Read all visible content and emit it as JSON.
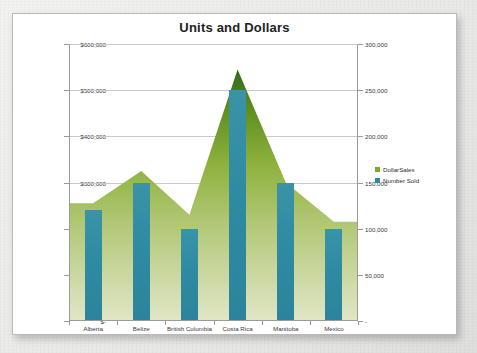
{
  "chart_data": {
    "type": "area",
    "title": "Units and Dollars",
    "categories": [
      "Alberta",
      "Belize",
      "British Columbia",
      "Costa Rica",
      "Manitoba",
      "Mexico"
    ],
    "series": [
      {
        "name": "DollarSales",
        "type": "area",
        "axis": "left",
        "color": "#7fa92e",
        "values": [
          255000,
          325000,
          230000,
          545000,
          300000,
          215000
        ]
      },
      {
        "name": "Number Sold",
        "type": "bar",
        "axis": "right",
        "color": "#2f8ba2",
        "values": [
          120000,
          150000,
          100000,
          250000,
          150000,
          100000
        ]
      }
    ],
    "xlabel": "",
    "ylabel": "",
    "ylim": [
      0,
      600000
    ],
    "y2lim": [
      0,
      300000
    ],
    "left_axis_ticks": [
      "$600,000",
      "$500,000",
      "$400,000",
      "$300,000",
      "$200,000",
      "$100,000",
      "$-"
    ],
    "left_axis_values": [
      600000,
      500000,
      400000,
      300000,
      200000,
      100000,
      0
    ],
    "right_axis_ticks": [
      "300,000",
      "250,000",
      "200,000",
      "150,000",
      "100,000",
      "50,000",
      "-"
    ],
    "right_axis_values": [
      300000,
      250000,
      200000,
      150000,
      100000,
      50000,
      0
    ],
    "grid": true,
    "legend_position": "right",
    "legend": [
      "DollarSales",
      "Number Sold"
    ]
  },
  "colors": {
    "bar": "#2f8ba2",
    "area_top": "#3a6b1e",
    "area_mid": "#8cb03c",
    "area_bottom": "#dde3c0",
    "gridline": "#c9c9c9",
    "axis": "#9a9a9a",
    "title": "#222222",
    "card_border": "#b9b9b9"
  }
}
